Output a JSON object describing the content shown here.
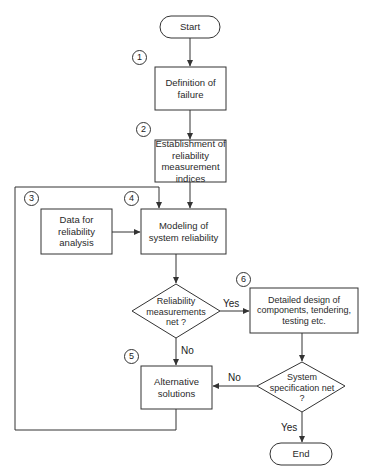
{
  "diagram": {
    "type": "flowchart",
    "colors": {
      "stroke": "#333333",
      "fill": "#ffffff",
      "text": "#222222"
    },
    "nodes": {
      "start": {
        "label": "Start",
        "shape": "terminal"
      },
      "definition": {
        "step": "1",
        "label": "Definition of failure",
        "shape": "process"
      },
      "establishment": {
        "step": "2",
        "label": "Establishment of reliability measurement indices",
        "shape": "process"
      },
      "data": {
        "step": "3",
        "label": "Data for reliability analysis",
        "shape": "process"
      },
      "modeling": {
        "step": "4",
        "label": "Modeling of system reliability",
        "shape": "process"
      },
      "reliability_decision": {
        "label": "Reliability measurements net ?",
        "shape": "decision"
      },
      "detailed_design": {
        "step": "6",
        "label": "Detailed design of components, tendering, testing etc.",
        "shape": "process"
      },
      "alternative": {
        "step": "5",
        "label": "Alternative solutions",
        "shape": "process"
      },
      "system_decision": {
        "label": "System specification net ?",
        "shape": "decision"
      },
      "end": {
        "label": "End",
        "shape": "terminal"
      }
    },
    "edge_labels": {
      "reliability_yes": "Yes",
      "reliability_no": "No",
      "system_no": "No",
      "system_yes": "Yes"
    },
    "edges": [
      {
        "from": "start",
        "to": "definition"
      },
      {
        "from": "definition",
        "to": "establishment"
      },
      {
        "from": "establishment",
        "to": "modeling"
      },
      {
        "from": "data",
        "to": "modeling"
      },
      {
        "from": "modeling",
        "to": "reliability_decision"
      },
      {
        "from": "reliability_decision",
        "to": "detailed_design",
        "label": "Yes"
      },
      {
        "from": "reliability_decision",
        "to": "alternative",
        "label": "No"
      },
      {
        "from": "detailed_design",
        "to": "system_decision"
      },
      {
        "from": "system_decision",
        "to": "alternative",
        "label": "No"
      },
      {
        "from": "system_decision",
        "to": "end",
        "label": "Yes"
      },
      {
        "from": "alternative",
        "to": "modeling",
        "label": "feedback loop"
      }
    ]
  }
}
